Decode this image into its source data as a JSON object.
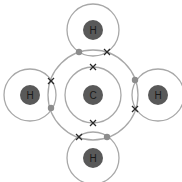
{
  "atoms": [
    {
      "id": "C",
      "label": "C",
      "x": 93,
      "y": 95,
      "shells": [
        28,
        45
      ]
    },
    {
      "id": "H_top",
      "label": "H",
      "x": 93,
      "y": 30,
      "shells": [
        26
      ]
    },
    {
      "id": "H_left",
      "label": "H",
      "x": 30,
      "y": 95,
      "shells": [
        26
      ]
    },
    {
      "id": "H_right",
      "label": "H",
      "x": 158,
      "y": 95,
      "shells": [
        26
      ]
    },
    {
      "id": "H_bottom",
      "label": "H",
      "x": 93,
      "y": 158,
      "shells": [
        26
      ]
    }
  ],
  "electrons": {
    "dots": [
      {
        "x": 79,
        "y": 52
      },
      {
        "x": 51,
        "y": 108
      },
      {
        "x": 135,
        "y": 80
      },
      {
        "x": 107,
        "y": 137
      }
    ],
    "crosses": [
      {
        "x": 107,
        "y": 52
      },
      {
        "x": 51,
        "y": 81
      },
      {
        "x": 135,
        "y": 109
      },
      {
        "x": 79,
        "y": 137
      },
      {
        "x": 93,
        "y": 67
      },
      {
        "x": 93,
        "y": 123
      }
    ]
  },
  "colors": {
    "shell": "#a8a8a8",
    "nucleus": "#595959",
    "dot": "#8c8c8c",
    "cross": "#2a2a2a"
  }
}
